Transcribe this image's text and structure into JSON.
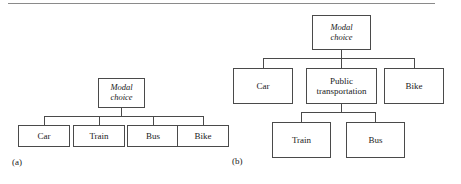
{
  "figure": {
    "type": "tree-diagram-pair",
    "panels": [
      {
        "id": "a",
        "label": "(a)",
        "root": {
          "name": "root-modal-choice",
          "text": "Modal\nchoice",
          "style": "italic"
        },
        "children": [
          {
            "name": "node-car",
            "text": "Car"
          },
          {
            "name": "node-train",
            "text": "Train"
          },
          {
            "name": "node-bus",
            "text": "Bus"
          },
          {
            "name": "node-bike",
            "text": "Bike"
          }
        ]
      },
      {
        "id": "b",
        "label": "(b)",
        "root": {
          "name": "root-modal-choice",
          "text": "Modal\nchoice",
          "style": "italic"
        },
        "children": [
          {
            "name": "node-car",
            "text": "Car"
          },
          {
            "name": "node-public-transportation",
            "text": "Public\ntransportation"
          },
          {
            "name": "node-bike",
            "text": "Bike"
          }
        ],
        "grandchildren": [
          {
            "name": "node-train",
            "text": "Train"
          },
          {
            "name": "node-bus",
            "text": "Bus"
          }
        ]
      }
    ]
  },
  "colors": {
    "box_border": "#4a4a4a",
    "connector": "#4a4a4a",
    "rule": "#8a8a8a",
    "text": "#1a1a1a",
    "background": "#ffffff"
  }
}
